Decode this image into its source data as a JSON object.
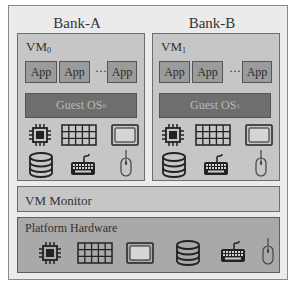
{
  "banks": [
    {
      "title": "Bank-A",
      "vm": {
        "name": "VM",
        "subscript": "0",
        "apps": [
          "App",
          "App",
          "App"
        ],
        "ellipsis": "···",
        "guest_os": "Guest OS",
        "guest_os_subscript": "0",
        "devices": [
          "cpu-icon",
          "memory-grid-icon",
          "display-icon",
          "storage-disk-icon",
          "keyboard-icon",
          "mouse-icon"
        ]
      }
    },
    {
      "title": "Bank-B",
      "vm": {
        "name": "VM",
        "subscript": "1",
        "apps": [
          "App",
          "App",
          "App"
        ],
        "ellipsis": "···",
        "guest_os": "Guest OS",
        "guest_os_subscript": "1",
        "devices": [
          "cpu-icon",
          "memory-grid-icon",
          "display-icon",
          "storage-disk-icon",
          "keyboard-icon",
          "mouse-icon"
        ]
      }
    }
  ],
  "vm_monitor": {
    "label": "VM Monitor"
  },
  "platform_hardware": {
    "label": "Platform Hardware",
    "devices": [
      "cpu-icon",
      "memory-grid-icon",
      "display-icon",
      "storage-disk-icon",
      "keyboard-icon",
      "mouse-icon"
    ]
  },
  "colors": {
    "frame_bg": "#ebebeb",
    "vm_bg": "#c6c6c6",
    "app_bg": "#9b9b9b",
    "guest_os_bg": "#6e6e6e",
    "platform_bg": "#a9a9a9"
  }
}
